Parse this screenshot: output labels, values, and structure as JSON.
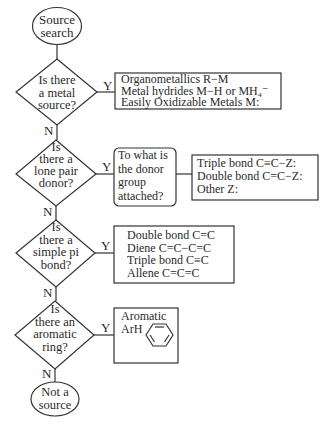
{
  "diagram": {
    "start": {
      "lines": [
        "Source",
        "search"
      ]
    },
    "end": {
      "lines": [
        "Not a",
        "source"
      ]
    },
    "yes_label": "Y",
    "no_label": "N",
    "decisions": [
      {
        "lines": [
          "Is there",
          "a metal",
          "source?"
        ]
      },
      {
        "lines": [
          "Is",
          "there a",
          "lone pair",
          "donor?"
        ]
      },
      {
        "lines": [
          "Is",
          "there a",
          "simple pi",
          "bond?"
        ]
      },
      {
        "lines": [
          "Is",
          "there an",
          "aromatic",
          "ring?"
        ]
      }
    ],
    "results": [
      {
        "lines": [
          "Organometallics R−M",
          "Metal hydrides M−H or MH₄⁻",
          "Easily Oxidizable Metals M:"
        ]
      },
      {
        "question": [
          "To what is",
          "the donor",
          "group",
          "attached?"
        ],
        "lines": [
          "Triple bond C≡C−Z:",
          "Double bond C=C−Z:",
          "Other Z:"
        ]
      },
      {
        "lines": [
          "Double bond C=C",
          "Diene C=C−C=C",
          "Triple bond C≡C",
          "Allene C=C=C"
        ]
      },
      {
        "lines": [
          "Aromatic",
          "ArH"
        ],
        "icon": "benzene-ring-icon"
      }
    ]
  }
}
